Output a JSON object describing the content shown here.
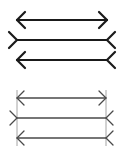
{
  "colors": {
    "top_stroke": "#1a1a1a",
    "bottom_stroke": "#4a4a4a",
    "guide_stroke": "#9a9a9a"
  },
  "panels": [
    {
      "name": "illusion-panel",
      "figures": [
        {
          "name": "arrows-out",
          "left_end": "arrowhead",
          "right_end": "arrowhead"
        },
        {
          "name": "fins-out",
          "left_end": "fin",
          "right_end": "fin"
        },
        {
          "name": "arrow-left-fin-right",
          "left_end": "arrowhead",
          "right_end": "fin"
        }
      ],
      "guides": false
    },
    {
      "name": "comparison-panel",
      "figures": [
        {
          "name": "arrows-out",
          "left_end": "arrowhead",
          "right_end": "arrowhead"
        },
        {
          "name": "fins-out",
          "left_end": "fin",
          "right_end": "fin"
        },
        {
          "name": "arrow-left-fin-right",
          "left_end": "arrowhead",
          "right_end": "fin"
        }
      ],
      "guides": true
    }
  ]
}
